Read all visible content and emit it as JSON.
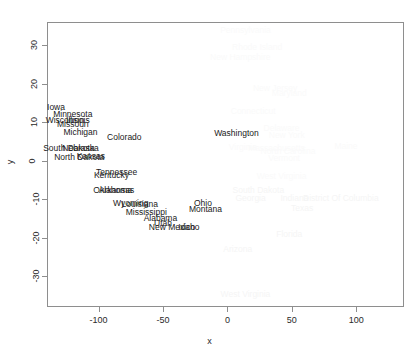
{
  "chart_data": {
    "type": "scatter",
    "title": "",
    "xlabel": "x",
    "ylabel": "y",
    "xlim": [
      -140,
      137
    ],
    "ylim": [
      -38,
      36
    ],
    "xticks": [
      -100,
      -50,
      0,
      50,
      100
    ],
    "yticks": [
      -30,
      -20,
      -10,
      0,
      10,
      20,
      30
    ],
    "xticklabels": [
      "-100",
      "-50",
      "0",
      "50",
      "100"
    ],
    "yticklabels": [
      "-30",
      "-20",
      "-10",
      "0",
      "10",
      "20",
      "30"
    ],
    "grid": false,
    "legend": null,
    "marker": "text-label",
    "points": [
      {
        "label": "Iowa",
        "x": -133,
        "y": 14.0,
        "shade": "dark"
      },
      {
        "label": "Minnesota",
        "x": -120,
        "y": 12.2,
        "shade": "dark"
      },
      {
        "label": "Wisconsin",
        "x": -126,
        "y": 10.6,
        "shade": "dark"
      },
      {
        "label": "Illinois",
        "x": -116,
        "y": 10.6,
        "shade": "dark"
      },
      {
        "label": "Missouri",
        "x": -120,
        "y": 9.4,
        "shade": "dark"
      },
      {
        "label": "Michigan",
        "x": -114,
        "y": 7.4,
        "shade": "dark"
      },
      {
        "label": "Colorado",
        "x": -80,
        "y": 6.2,
        "shade": "dark"
      },
      {
        "label": "South Dakota",
        "x": -123,
        "y": 3.2,
        "shade": "dark"
      },
      {
        "label": "Nebraska",
        "x": -114,
        "y": 3.2,
        "shade": "dark"
      },
      {
        "label": "North Dakota",
        "x": -115,
        "y": 1.0,
        "shade": "dark"
      },
      {
        "label": "Kansas",
        "x": -106,
        "y": 1.2,
        "shade": "dark"
      },
      {
        "label": "Tennessee",
        "x": -86,
        "y": -3.0,
        "shade": "dark"
      },
      {
        "label": "Kentucky",
        "x": -90,
        "y": -3.8,
        "shade": "dark"
      },
      {
        "label": "Oklahoma",
        "x": -89,
        "y": -7.6,
        "shade": "dark"
      },
      {
        "label": "Arkansas",
        "x": -86,
        "y": -7.6,
        "shade": "dark"
      },
      {
        "label": "Wyoming",
        "x": -75,
        "y": -11.0,
        "shade": "dark"
      },
      {
        "label": "Louisiana",
        "x": -68,
        "y": -11.2,
        "shade": "dark"
      },
      {
        "label": "Mississippi",
        "x": -63,
        "y": -13.4,
        "shade": "dark"
      },
      {
        "label": "Alabama",
        "x": -52,
        "y": -15.0,
        "shade": "dark"
      },
      {
        "label": "Utah",
        "x": -50,
        "y": -16.2,
        "shade": "dark"
      },
      {
        "label": "New Mexico",
        "x": -43,
        "y": -17.2,
        "shade": "dark"
      },
      {
        "label": "Idaho",
        "x": -30,
        "y": -17.2,
        "shade": "dark"
      },
      {
        "label": "Ohio",
        "x": -19,
        "y": -11.0,
        "shade": "dark"
      },
      {
        "label": "Montana",
        "x": -17,
        "y": -12.6,
        "shade": "dark"
      },
      {
        "label": "Washington",
        "x": 7,
        "y": 7.2,
        "shade": "dark"
      },
      {
        "label": "Pennsylvania",
        "x": 14,
        "y": 34.0,
        "shade": "faint"
      },
      {
        "label": "Rhode Island",
        "x": 23,
        "y": 29.6,
        "shade": "faint"
      },
      {
        "label": "New Hampshire",
        "x": 10,
        "y": 26.8,
        "shade": "faint"
      },
      {
        "label": "New Jersey",
        "x": 37,
        "y": 18.8,
        "shade": "faint"
      },
      {
        "label": "Maryland",
        "x": 48,
        "y": 17.6,
        "shade": "faint"
      },
      {
        "label": "Connecticut",
        "x": 20,
        "y": 13.0,
        "shade": "faint"
      },
      {
        "label": "Delaware",
        "x": 42,
        "y": 8.4,
        "shade": "faint"
      },
      {
        "label": "New York",
        "x": 46,
        "y": 6.6,
        "shade": "faint"
      },
      {
        "label": "Virginia",
        "x": 12,
        "y": 3.6,
        "shade": "faint"
      },
      {
        "label": "Massachusetts",
        "x": 38,
        "y": 3.4,
        "shade": "faint"
      },
      {
        "label": "North Carolina",
        "x": 47,
        "y": 2.6,
        "shade": "faint"
      },
      {
        "label": "Maine",
        "x": 92,
        "y": 3.8,
        "shade": "faint"
      },
      {
        "label": "Vermont",
        "x": 44,
        "y": 0.6,
        "shade": "faint"
      },
      {
        "label": "West Virginia",
        "x": 42,
        "y": -4.0,
        "shade": "faint"
      },
      {
        "label": "South Dakota",
        "x": 24,
        "y": -7.6,
        "shade": "faint2"
      },
      {
        "label": "Georgia",
        "x": 18,
        "y": -9.8,
        "shade": "faint2"
      },
      {
        "label": "Indiana",
        "x": 52,
        "y": -9.8,
        "shade": "faint2"
      },
      {
        "label": "District Of Columbia",
        "x": 88,
        "y": -9.8,
        "shade": "faint2"
      },
      {
        "label": "Texas",
        "x": 58,
        "y": -12.4,
        "shade": "faint2"
      },
      {
        "label": "Florida",
        "x": 48,
        "y": -19.0,
        "shade": "faint2"
      },
      {
        "label": "Arizona",
        "x": 8,
        "y": -23.0,
        "shade": "faint2"
      },
      {
        "label": "West Virginia",
        "x": 14,
        "y": -34.6,
        "shade": "faint2"
      }
    ]
  },
  "axes": {
    "x_label": "x",
    "y_label": "y"
  }
}
